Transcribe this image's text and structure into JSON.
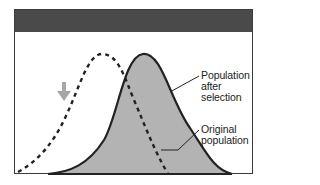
{
  "diagram": {
    "type": "directional-selection-curves",
    "colors": {
      "frame_border": "#3a3a3a",
      "header_bar": "#4a4a4a",
      "after_fill": "#b3b3b3",
      "curve_stroke": "#222222",
      "arrow": "#a6a6a6"
    },
    "curves": [
      {
        "id": "original",
        "style": "dashed",
        "peak_x_px": 102,
        "peak_y_px": 54
      },
      {
        "id": "after_selection",
        "style": "solid-filled",
        "peak_x_px": 143,
        "peak_y_px": 54
      }
    ],
    "arrow": {
      "icon": "down-arrow-icon",
      "meaning": "selection pressure"
    },
    "labels": {
      "after_selection": [
        "Population",
        "after",
        "selection"
      ],
      "original": [
        "Original",
        "population"
      ]
    }
  }
}
